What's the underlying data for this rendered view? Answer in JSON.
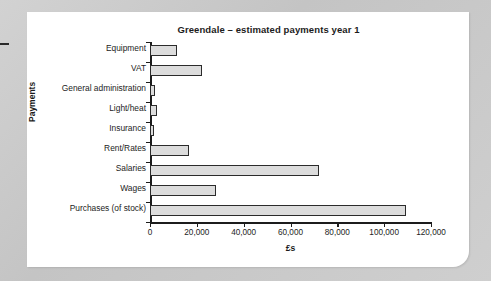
{
  "chart_data": {
    "type": "bar",
    "orientation": "horizontal",
    "title": "Greendale – estimated payments year 1",
    "xlabel": "£s",
    "ylabel": "Payments",
    "xlim": [
      0,
      120000
    ],
    "xticks": [
      0,
      20000,
      40000,
      60000,
      80000,
      100000,
      120000
    ],
    "xtick_labels": [
      "0",
      "20,000",
      "40,000",
      "60,000",
      "80,000",
      "100,000",
      "120,000"
    ],
    "grid": false,
    "legend": null,
    "categories": [
      "Equipment",
      "VAT",
      "General administration",
      "Light/heat",
      "Insurance",
      "Rent/Rates",
      "Salaries",
      "Wages",
      "Purchases (of stock)"
    ],
    "values": [
      11500,
      22000,
      2200,
      2800,
      1700,
      16500,
      72000,
      28000,
      109500
    ],
    "bar_fill_color": "#dcdcdc",
    "bar_border_color": "#2b2b2b",
    "axis_color": "#1c1c1c"
  },
  "page": {
    "background_color": "#c9c9c9",
    "card_color": "#ffffff"
  }
}
